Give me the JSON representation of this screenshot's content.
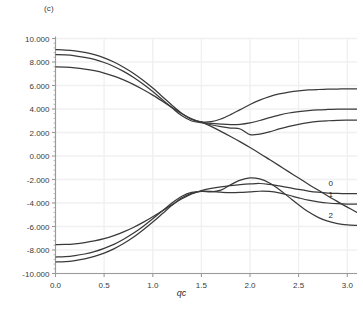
{
  "panel": {
    "label": "(c)"
  },
  "chart_data": {
    "type": "line",
    "title": "",
    "subtitle": "",
    "xlabel": "qc",
    "ylabel": "",
    "xlim": [
      0.0,
      3.1
    ],
    "ylim": [
      -10.0,
      10.0
    ],
    "grid": true,
    "legend_position": "inline-right",
    "xticks": [
      0.0,
      0.5,
      1.0,
      1.5,
      2.0,
      2.5,
      3.0
    ],
    "xticklabels": [
      "0.0",
      "0.5",
      "1.0",
      "1.5",
      "2.0",
      "2.5",
      "3.0"
    ],
    "yticks": [
      -10.0,
      -8.0,
      -6.0,
      -4.0,
      -2.0,
      0.0,
      2.0,
      4.0,
      6.0,
      8.0,
      10.0
    ],
    "yticklabels": [
      "-10.000",
      "-8.000",
      "-6.000",
      "-4.000",
      "-2.000",
      "0.000",
      "2.000",
      "4.000",
      "6.000",
      "8.000",
      "10.000"
    ],
    "annotations": [
      {
        "text": "0",
        "x": 2.83,
        "y": -2.55
      },
      {
        "text": "1",
        "x": 2.83,
        "y": -3.45
      },
      {
        "text": "2",
        "x": 2.83,
        "y": -5.25
      }
    ],
    "x": [
      0.0,
      0.1,
      0.2,
      0.3,
      0.4,
      0.5,
      0.6,
      0.7,
      0.8,
      0.9,
      1.0,
      1.1,
      1.2,
      1.3,
      1.4,
      1.5,
      1.6,
      1.7,
      1.8,
      1.9,
      2.0,
      2.1,
      2.2,
      2.3,
      2.4,
      2.5,
      2.6,
      2.7,
      2.8,
      2.9,
      3.0,
      3.1
    ],
    "series": [
      {
        "name": "upper-branch-a",
        "values": [
          9.05,
          9.02,
          8.95,
          8.82,
          8.62,
          8.35,
          8.0,
          7.56,
          7.05,
          6.45,
          5.78,
          5.05,
          4.3,
          3.62,
          3.12,
          2.9,
          2.92,
          3.15,
          3.52,
          3.95,
          4.38,
          4.76,
          5.06,
          5.28,
          5.44,
          5.55,
          5.62,
          5.66,
          5.69,
          5.7,
          5.71,
          5.71
        ]
      },
      {
        "name": "upper-branch-b",
        "values": [
          8.62,
          8.6,
          8.53,
          8.4,
          8.22,
          7.96,
          7.62,
          7.2,
          6.7,
          6.12,
          5.48,
          4.78,
          4.08,
          3.42,
          2.98,
          2.84,
          2.78,
          2.72,
          2.68,
          2.7,
          2.82,
          3.02,
          3.26,
          3.48,
          3.66,
          3.78,
          3.87,
          3.93,
          3.96,
          3.98,
          3.99,
          3.99
        ]
      },
      {
        "name": "upper-branch-c",
        "values": [
          7.58,
          7.56,
          7.5,
          7.4,
          7.26,
          7.06,
          6.8,
          6.48,
          6.1,
          5.66,
          5.18,
          4.66,
          4.12,
          3.6,
          3.16,
          2.86,
          2.66,
          2.5,
          2.38,
          2.3,
          1.82,
          1.86,
          2.05,
          2.3,
          2.52,
          2.7,
          2.84,
          2.94,
          3.0,
          3.04,
          3.05,
          3.05
        ]
      },
      {
        "name": "lower-branch-a",
        "values": [
          -9.02,
          -8.99,
          -8.9,
          -8.76,
          -8.55,
          -8.26,
          -7.9,
          -7.45,
          -6.92,
          -6.3,
          -5.62,
          -4.9,
          -4.18,
          -3.56,
          -3.18,
          -3.02,
          -3.05,
          -2.9,
          -2.45,
          -2.05,
          -1.86,
          -1.95,
          -2.3,
          -2.85,
          -3.5,
          -4.15,
          -4.75,
          -5.22,
          -5.55,
          -5.75,
          -5.86,
          -5.9
        ]
      },
      {
        "name": "lower-branch-b",
        "values": [
          -8.6,
          -8.57,
          -8.48,
          -8.34,
          -8.14,
          -7.86,
          -7.52,
          -7.08,
          -6.58,
          -6.0,
          -5.35,
          -4.66,
          -3.98,
          -3.42,
          -3.1,
          -3.0,
          -3.02,
          -3.08,
          -3.12,
          -3.1,
          -3.05,
          -3.0,
          -3.02,
          -3.14,
          -3.34,
          -3.56,
          -3.76,
          -3.9,
          -4.0,
          -4.06,
          -4.09,
          -4.1
        ]
      },
      {
        "name": "lower-branch-c",
        "values": [
          -7.55,
          -7.53,
          -7.47,
          -7.37,
          -7.23,
          -7.04,
          -6.78,
          -6.46,
          -6.08,
          -5.65,
          -5.17,
          -4.66,
          -4.14,
          -3.64,
          -3.22,
          -2.94,
          -2.76,
          -2.62,
          -2.52,
          -2.44,
          -2.38,
          -2.34,
          -2.42,
          -2.55,
          -2.7,
          -2.85,
          -2.98,
          -3.08,
          -3.15,
          -3.19,
          -3.21,
          -3.21
        ]
      },
      {
        "name": "crossing-branch",
        "values": [
          null,
          null,
          null,
          null,
          null,
          null,
          null,
          null,
          null,
          null,
          null,
          null,
          null,
          null,
          null,
          2.9,
          2.52,
          2.1,
          1.66,
          1.2,
          0.72,
          0.22,
          -0.3,
          -0.82,
          -1.35,
          -1.88,
          -2.4,
          -2.9,
          -3.4,
          -3.88,
          -4.35,
          -4.8
        ]
      }
    ],
    "series_colors": {
      "curve": "#3a3a3a",
      "grid": "#f0f0f2",
      "axis": "#9a9a9a"
    }
  }
}
